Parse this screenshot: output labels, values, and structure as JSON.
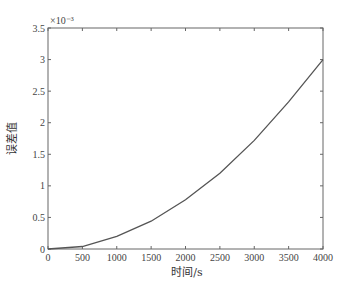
{
  "chart_data": {
    "type": "line",
    "title": "",
    "xlabel": "时间/s",
    "ylabel": "误差值",
    "y_multiplier": "×10⁻³",
    "xlim": [
      0,
      4000
    ],
    "ylim": [
      0,
      3.5
    ],
    "x_ticks": [
      0,
      500,
      1000,
      1500,
      2000,
      2500,
      3000,
      3500,
      4000
    ],
    "y_ticks": [
      0,
      0.5,
      1,
      1.5,
      2,
      2.5,
      3,
      3.5
    ],
    "x_tick_labels": [
      "0",
      "500",
      "1000",
      "1500",
      "2000",
      "2500",
      "3000",
      "3500",
      "4000"
    ],
    "y_tick_labels": [
      "0",
      "0.5",
      "1",
      "1.5",
      "2",
      "2.5",
      "3",
      "3.5"
    ],
    "grid": false,
    "legend": null,
    "series": [
      {
        "name": "误差值",
        "color": "#555555",
        "x": [
          0,
          500,
          1000,
          1500,
          2000,
          2500,
          3000,
          3500,
          4000
        ],
        "y": [
          0,
          0.04,
          0.2,
          0.44,
          0.78,
          1.2,
          1.72,
          2.33,
          3.0
        ]
      }
    ]
  }
}
